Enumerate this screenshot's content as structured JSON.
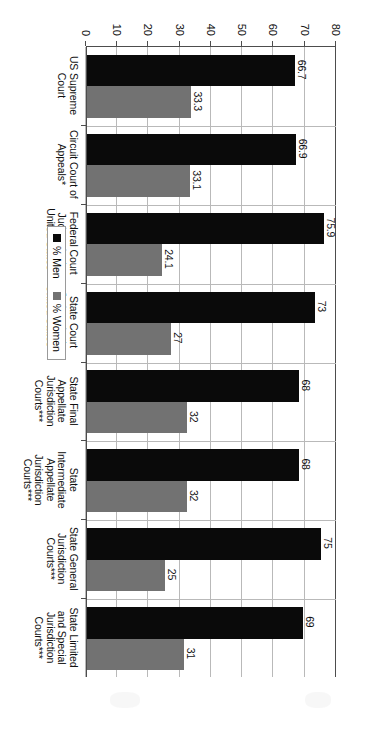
{
  "chart_data": {
    "type": "bar",
    "orientation": "horizontal",
    "title": "",
    "subtitle": "",
    "xlabel": "",
    "ylabel": "",
    "ylim": [
      0,
      80
    ],
    "ticks": [
      "0",
      "10",
      "20",
      "30",
      "40",
      "50",
      "60",
      "70",
      "80"
    ],
    "tick_values": [
      0,
      10,
      20,
      30,
      40,
      50,
      60,
      70,
      80
    ],
    "grid": true,
    "legend_position": "middle-left",
    "categories": [
      "US Supreme\nCourt",
      "Circuit Court of\nAppeals*",
      "Federal Court\nJudges in the\nUnited States**",
      "State Court\nJudges in the\nUnited States***",
      "State Final\nAppellate\nJurisdiction\nCourts***",
      "State\nIntermediate\nAppellate\nJurisdiction\nCourts***",
      "State General\nJurisdiction\nCourts***",
      "State Limited\nand Special\nJurisdiction\nCourts***"
    ],
    "series": [
      {
        "name": "% Men",
        "color": "#0a0a0a",
        "values": [
          66.7,
          66.9,
          75.9,
          73,
          68,
          68,
          75,
          69
        ],
        "labels": [
          "66.7",
          "66.9",
          "75.9",
          "73",
          "68",
          "68",
          "75",
          "69"
        ]
      },
      {
        "name": "% Women",
        "color": "#727272",
        "values": [
          33.3,
          33.1,
          24.1,
          27,
          32,
          32,
          25,
          31
        ],
        "labels": [
          "33.3",
          "33.1",
          "24.1",
          "27",
          "32",
          "32",
          "25",
          "31"
        ]
      }
    ]
  },
  "legend": {
    "entries": [
      {
        "label": "% Men",
        "color": "#0a0a0a"
      },
      {
        "label": "% Women",
        "color": "#727272"
      }
    ]
  },
  "colors": {
    "men": "#0a0a0a",
    "women": "#727272",
    "grid": "#b9b9b9",
    "axis": "#4d4d4d",
    "background": "#ffffff"
  }
}
